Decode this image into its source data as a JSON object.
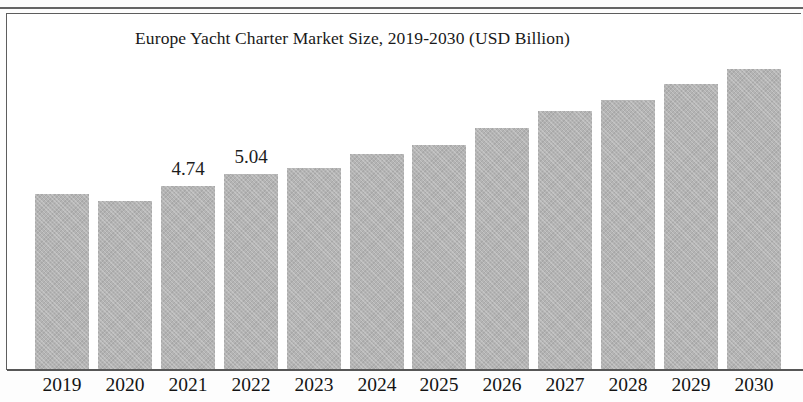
{
  "chart_data": {
    "type": "bar",
    "title": "Europe Yacht Charter Market Size, 2019-2030 (USD Billion)",
    "xlabel": "",
    "ylabel": "",
    "unit": "USD Billion",
    "grid": false,
    "legend": false,
    "axis": {
      "y_visible": false,
      "x_visible": true,
      "ylim": [
        0,
        8.2
      ]
    },
    "categories": [
      "2019",
      "2020",
      "2021",
      "2022",
      "2023",
      "2024",
      "2025",
      "2026",
      "2027",
      "2028",
      "2029",
      "2030"
    ],
    "values": [
      4.54,
      4.34,
      4.74,
      5.04,
      5.22,
      5.58,
      5.81,
      6.25,
      6.69,
      6.97,
      7.38,
      7.76
    ],
    "data_labels": [
      "",
      "",
      "4.74",
      "5.04",
      "",
      "",
      "",
      "",
      "",
      "",
      "",
      ""
    ],
    "series": [
      {
        "name": "Europe Yacht Charter Market Size",
        "values": [
          4.54,
          4.34,
          4.74,
          5.04,
          5.22,
          5.58,
          5.81,
          6.25,
          6.69,
          6.97,
          7.38,
          7.76
        ]
      }
    ],
    "colors": {
      "bar_fill": "#b4b4b4",
      "axis_line": "#575757",
      "frame": "#5d5d5d",
      "text": "#191919",
      "background": "#ffffff"
    }
  }
}
